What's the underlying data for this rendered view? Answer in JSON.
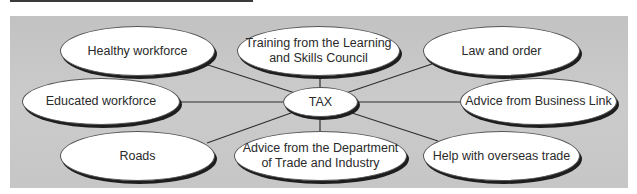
{
  "diagram": {
    "center": {
      "label": "TAX"
    },
    "nodes": [
      {
        "id": "healthy",
        "label": "Healthy workforce"
      },
      {
        "id": "training",
        "label": "Training from the Learning and Skills Council",
        "line1": "Training from the Learning",
        "line2": "and Skills Council"
      },
      {
        "id": "law",
        "label": "Law and order"
      },
      {
        "id": "educated",
        "label": "Educated workforce"
      },
      {
        "id": "business",
        "label": "Advice from Business Link"
      },
      {
        "id": "roads",
        "label": "Roads"
      },
      {
        "id": "dti",
        "label": "Advice from the Department of Trade and Industry",
        "line1": "Advice from the Department",
        "line2": "of Trade and Industry"
      },
      {
        "id": "overseas",
        "label": "Help with overseas trade"
      }
    ]
  },
  "colors": {
    "panel": "#c8c8c8",
    "node_fill": "#ffffff",
    "shadow": "#1e1e1e",
    "line": "#2e2e2e"
  }
}
